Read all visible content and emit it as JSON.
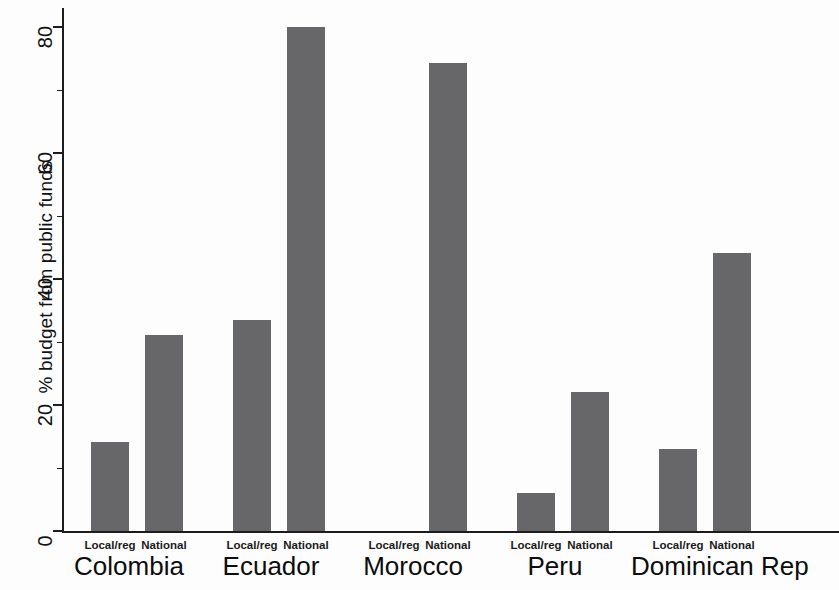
{
  "chart_data": {
    "type": "bar",
    "title": "",
    "xlabel": "",
    "ylabel": "% budget from public funds",
    "ylim": [
      0,
      84
    ],
    "yticks": [
      0,
      20,
      40,
      60,
      80
    ],
    "ytick_labels": [
      "0",
      "20",
      "40",
      "60",
      "80"
    ],
    "grid": false,
    "legend": "none",
    "categories": [
      "Colombia",
      "Ecuador",
      "Morocco",
      "Peru",
      "Dominican Rep"
    ],
    "subcategories": [
      "Local/reg",
      "National"
    ],
    "series": [
      {
        "name": "Local/reg",
        "values": [
          14.1,
          33.5,
          0,
          6.0,
          13.0
        ]
      },
      {
        "name": "National",
        "values": [
          31.1,
          80.0,
          74.3,
          22.1,
          44.1
        ]
      }
    ],
    "bar_color": "#67676a",
    "axis_color": "#1c1c1c",
    "background": "#ffffff"
  },
  "axis": {
    "y_title": "% budget from public funds",
    "ticks": [
      {
        "label": "80",
        "value": 80
      },
      {
        "label": "60",
        "value": 60
      },
      {
        "label": "40",
        "value": 40
      },
      {
        "label": "20",
        "value": 20
      },
      {
        "label": "0",
        "value": 0
      }
    ]
  },
  "groups": [
    {
      "name": "Colombia",
      "bars": [
        {
          "label": "Local/reg",
          "value": 14.1
        },
        {
          "label": "National",
          "value": 31.1
        }
      ]
    },
    {
      "name": "Ecuador",
      "bars": [
        {
          "label": "Local/reg",
          "value": 33.5
        },
        {
          "label": "National",
          "value": 80.0
        }
      ]
    },
    {
      "name": "Morocco",
      "bars": [
        {
          "label": "Local/reg",
          "value": 0
        },
        {
          "label": "National",
          "value": 74.3
        }
      ]
    },
    {
      "name": "Peru",
      "bars": [
        {
          "label": "Local/reg",
          "value": 6.0
        },
        {
          "label": "National",
          "value": 22.1
        }
      ]
    },
    {
      "name": "Dominican Rep",
      "bars": [
        {
          "label": "Local/reg",
          "value": 13.0
        },
        {
          "label": "National",
          "value": 44.1
        }
      ]
    }
  ]
}
